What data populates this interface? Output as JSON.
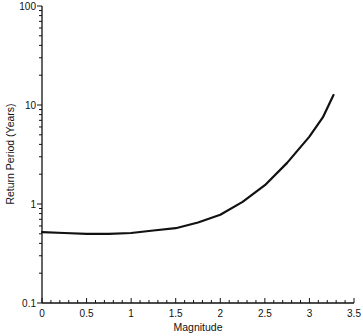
{
  "chart_data": {
    "type": "line",
    "title": "",
    "xlabel": "Magnitude",
    "ylabel": "Return Period (Years)",
    "xscale": "linear",
    "yscale": "log",
    "xlim": [
      0,
      3.5
    ],
    "ylim": [
      0.1,
      100
    ],
    "grid": false,
    "legend": null,
    "x_ticks": [
      "0",
      "0.5",
      "1",
      "1.5",
      "2",
      "2.5",
      "3",
      "3.5"
    ],
    "y_ticks": [
      "0.1",
      "1",
      "10",
      "100"
    ],
    "series": [
      {
        "name": "Return period curve",
        "x": [
          0.0,
          0.25,
          0.5,
          0.75,
          1.0,
          1.25,
          1.5,
          1.75,
          2.0,
          2.25,
          2.5,
          2.75,
          3.0,
          3.15,
          3.27
        ],
        "y": [
          0.52,
          0.51,
          0.5,
          0.5,
          0.51,
          0.54,
          0.57,
          0.65,
          0.78,
          1.05,
          1.55,
          2.6,
          4.8,
          7.5,
          12.6
        ]
      }
    ]
  },
  "colors": {
    "line": "#111111",
    "axis": "#111111",
    "background": "#ffffff"
  }
}
